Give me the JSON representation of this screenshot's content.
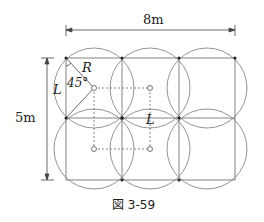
{
  "figure": {
    "width_label": "8m",
    "height_label": "5m",
    "radius_label": "R",
    "angle_label": "45°",
    "side_label_left": "L",
    "spacing_label": "L",
    "caption": "図 3-59"
  },
  "colors": {
    "line": "#888888",
    "text": "#222222"
  }
}
